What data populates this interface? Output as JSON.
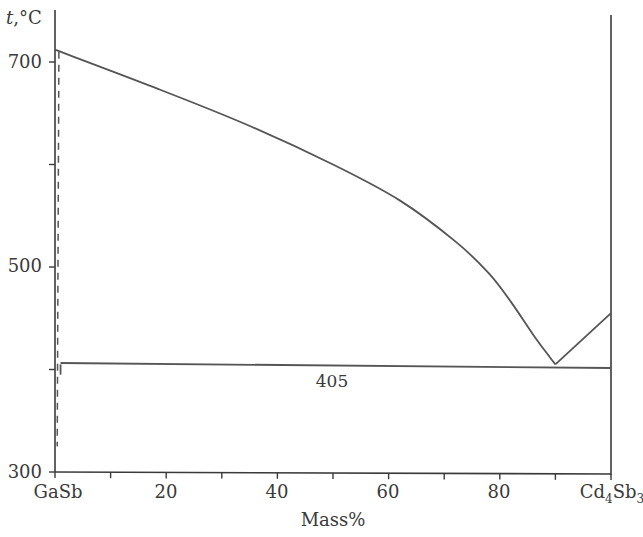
{
  "chart_data": {
    "type": "line",
    "title": "",
    "subtitle": "Phase diagram GaSb – Cd4Sb3",
    "xlabel": "Mass%",
    "ylabel": "t,°C",
    "xlim": [
      0,
      100
    ],
    "ylim": [
      300,
      720
    ],
    "grid": false,
    "legend": null,
    "x_ticks": [
      0,
      10,
      20,
      30,
      40,
      50,
      60,
      70,
      80,
      90,
      100
    ],
    "x_tick_labels": [
      {
        "x": 0,
        "label": "GaSb"
      },
      {
        "x": 20,
        "label": "20"
      },
      {
        "x": 40,
        "label": "40"
      },
      {
        "x": 60,
        "label": "60"
      },
      {
        "x": 80,
        "label": "80"
      },
      {
        "x": 100,
        "label": "Cd4Sb3",
        "rich": {
          "base1": "Cd",
          "sub1": "4",
          "base2": "Sb",
          "sub2": "3"
        }
      }
    ],
    "y_ticks": [
      300,
      400,
      500,
      600,
      700
    ],
    "y_tick_labels": [
      {
        "y": 300,
        "label": "300"
      },
      {
        "y": 500,
        "label": "500"
      },
      {
        "y": 700,
        "label": "700"
      }
    ],
    "series": [
      {
        "name": "Liquidus (GaSb side)",
        "style": "solid",
        "x": [
          0,
          17,
          34,
          50,
          62,
          72,
          78,
          82,
          86,
          89,
          90
        ],
        "y": [
          712,
          677,
          640,
          600,
          565,
          525,
          494,
          466,
          434,
          412,
          405
        ]
      },
      {
        "name": "Liquidus (Cd4Sb3 side)",
        "style": "solid",
        "x": [
          90,
          100
        ],
        "y": [
          405,
          455
        ]
      },
      {
        "name": "Eutectic horizontal",
        "style": "solid",
        "x": [
          1,
          100
        ],
        "y": [
          405,
          405
        ]
      },
      {
        "name": "Solid solution boundary (GaSb)",
        "style": "dashed",
        "x": [
          0.7,
          0.4
        ],
        "y": [
          710,
          325
        ]
      },
      {
        "name": "Solidus segment",
        "style": "solid",
        "x": [
          1,
          1
        ],
        "y": [
          405,
          395
        ]
      }
    ],
    "annotations": [
      {
        "text": "405",
        "x": 50,
        "y": 390,
        "meaning": "Eutectic temperature 405 °C"
      }
    ],
    "eutectic_point": {
      "x": 90,
      "y": 405
    }
  },
  "labels": {
    "y_axis_title_italic": "t",
    "y_axis_title_rest": ",°C",
    "x_axis_title": "Mass%",
    "annotation_405": "405",
    "tick_700": "700",
    "tick_500": "500",
    "tick_300": "300",
    "tick_gasb": "GaSb",
    "tick_20": "20",
    "tick_40": "40",
    "tick_60": "60",
    "tick_80": "80",
    "tick_cd": "Cd",
    "tick_cd_sub": "4",
    "tick_sb": "Sb",
    "tick_sb_sub": "3"
  },
  "colors": {
    "line": "#555555",
    "axis": "#3a3a3a",
    "text": "#3a3a3a",
    "background": "#ffffff"
  }
}
